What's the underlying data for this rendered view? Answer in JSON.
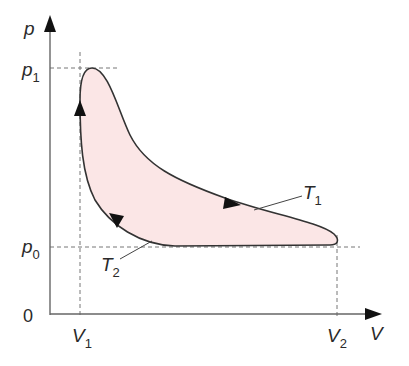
{
  "diagram": {
    "type": "pV-cycle",
    "axes": {
      "y_label": "p",
      "x_label": "V",
      "origin_label": "0"
    },
    "ticks": {
      "p1": {
        "symbol": "p",
        "subscript": "1"
      },
      "p0": {
        "symbol": "p",
        "subscript": "0"
      },
      "V1": {
        "symbol": "V",
        "subscript": "1"
      },
      "V2": {
        "symbol": "V",
        "subscript": "2"
      }
    },
    "curve_labels": {
      "T1": {
        "symbol": "T",
        "subscript": "1"
      },
      "T2": {
        "symbol": "T",
        "subscript": "2"
      }
    },
    "colors": {
      "fill": "#fbe6e6",
      "stroke": "#333333",
      "axis": "#555555",
      "dashed": "#777777"
    }
  }
}
